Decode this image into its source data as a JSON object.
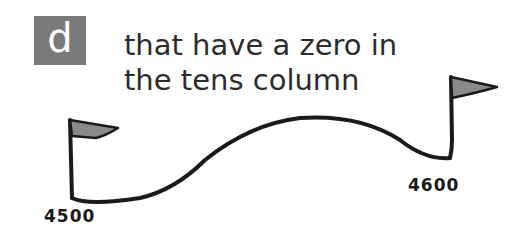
{
  "question": {
    "letter": "d",
    "text_line1": "that have a zero in",
    "text_line2": "the tens column"
  },
  "number_line": {
    "start_label": "4500",
    "end_label": "4600"
  },
  "colors": {
    "badge_bg": "#7a7a7a",
    "flag_fill": "#8a8a8a",
    "line": "#1a1a1a"
  }
}
